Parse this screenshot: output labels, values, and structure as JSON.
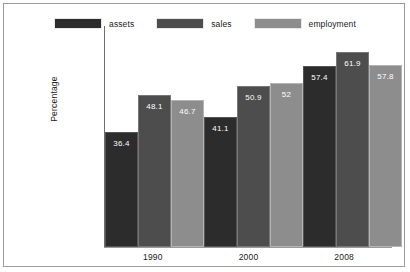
{
  "chart_data": {
    "type": "bar",
    "title": "",
    "xlabel": "",
    "ylabel": "Percentage",
    "categories": [
      "1990",
      "2000",
      "2008"
    ],
    "series": [
      {
        "name": "assets",
        "color": "#2c2c2c",
        "values": [
          36.4,
          41.1,
          57.4
        ],
        "labels": [
          "36.4",
          "41.1",
          "57.4"
        ]
      },
      {
        "name": "sales",
        "color": "#4d4d4d",
        "values": [
          48.1,
          50.9,
          61.9
        ],
        "labels": [
          "48.1",
          "50.9",
          "61.9"
        ]
      },
      {
        "name": "employment",
        "color": "#8d8d8d",
        "values": [
          46.7,
          52.0,
          57.8
        ],
        "labels": [
          "46.7",
          "52",
          "57.8"
        ]
      }
    ],
    "ylim": [
      0,
      70
    ],
    "grid": false,
    "legend_position": "top-center",
    "value_labels_inside_bars": true
  },
  "legend": {
    "items": [
      {
        "label": "assets",
        "color": "#2c2c2c"
      },
      {
        "label": "sales",
        "color": "#4d4d4d"
      },
      {
        "label": "employment",
        "color": "#8d8d8d"
      }
    ]
  },
  "axes": {
    "y_title": "Percentage",
    "x_ticks": [
      "1990",
      "2000",
      "2008"
    ]
  }
}
